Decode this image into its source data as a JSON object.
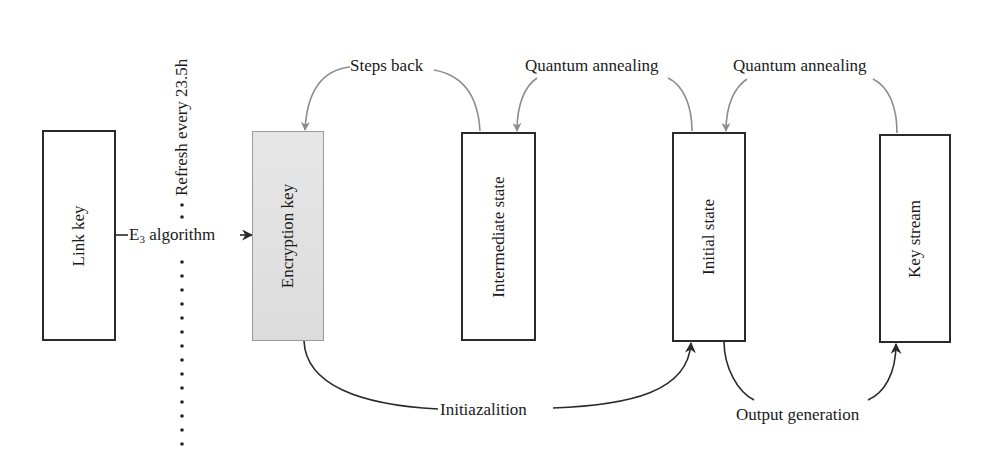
{
  "diagram": {
    "nodes": [
      {
        "id": "link-key",
        "label": "Link key",
        "shaded": false
      },
      {
        "id": "encryption-key",
        "label": "Encryption key",
        "shaded": true
      },
      {
        "id": "intermediate-state",
        "label": "Intermediate state",
        "shaded": false
      },
      {
        "id": "initial-state",
        "label": "Initial state",
        "shaded": false
      },
      {
        "id": "key-stream",
        "label": "Key stream",
        "shaded": false
      }
    ],
    "edges": {
      "e3_algorithm": {
        "prefix": "E",
        "subscript": "3",
        "suffix": " algorithm"
      },
      "steps_back": "Steps back",
      "quantum_annealing_1": "Quantum annealing",
      "quantum_annealing_2": "Quantum annealing",
      "initialization": "Initiazalition",
      "output_generation": "Output generation"
    },
    "refresh_label": "Refresh every 23.5h",
    "colors": {
      "box_border": "#2a2a2a",
      "shaded_fill": "#e0e0e0",
      "gray_arrow": "#8c8c8c",
      "dark_arrow": "#2a2a2a"
    }
  }
}
